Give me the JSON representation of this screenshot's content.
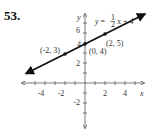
{
  "problem_number": "53.",
  "equation": {
    "lhs": "y =",
    "frac_num": "1",
    "frac_den": "2",
    "rhs": "x + 4"
  },
  "axes": {
    "x_label": "x",
    "y_label": "y",
    "x_ticks": [
      "-4",
      "-2",
      "2",
      "4"
    ],
    "y_ticks": [
      "6",
      "4",
      "2",
      "-2"
    ]
  },
  "points": [
    {
      "label": "(-2, 3)",
      "x": -2,
      "y": 3
    },
    {
      "label": "(0, 4)",
      "x": 0,
      "y": 4
    },
    {
      "label": "(2, 5)",
      "x": 2,
      "y": 5
    }
  ],
  "colors": {
    "line": "#111111",
    "axis": "#555555"
  }
}
